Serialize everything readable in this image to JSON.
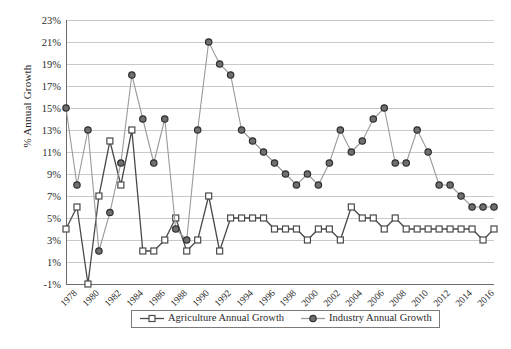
{
  "chart_data": {
    "type": "line",
    "title": "",
    "xlabel": "",
    "ylabel": "% Annual Growth",
    "ylim": [
      -1,
      23
    ],
    "ytick_step": 2,
    "ytick_labels": [
      "23%",
      "21%",
      "19%",
      "17%",
      "15%",
      "13%",
      "11%",
      "9%",
      "7%",
      "5%",
      "3%",
      "1%",
      "-1%"
    ],
    "ytick_values": [
      23,
      21,
      19,
      17,
      15,
      13,
      11,
      9,
      7,
      5,
      3,
      1,
      -1
    ],
    "grid": true,
    "legend_position": "bottom-center",
    "x": [
      1978,
      1979,
      1980,
      1981,
      1982,
      1983,
      1984,
      1985,
      1986,
      1987,
      1988,
      1989,
      1990,
      1991,
      1992,
      1993,
      1994,
      1995,
      1996,
      1997,
      1998,
      1999,
      2000,
      2001,
      2002,
      2003,
      2004,
      2005,
      2006,
      2007,
      2008,
      2009,
      2010,
      2011,
      2012,
      2013,
      2014,
      2015,
      2016,
      2017
    ],
    "xtick_labels": [
      "1978",
      "1980",
      "1982",
      "1984",
      "1986",
      "1988",
      "1990",
      "1992",
      "1994",
      "1996",
      "1998",
      "2000",
      "2002",
      "2004",
      "2006",
      "2008",
      "2010",
      "2012",
      "2014",
      "2016"
    ],
    "xtick_values": [
      1978,
      1980,
      1982,
      1984,
      1986,
      1988,
      1990,
      1992,
      1994,
      1996,
      1998,
      2000,
      2002,
      2004,
      2006,
      2008,
      2010,
      2012,
      2014,
      2016
    ],
    "series": [
      {
        "name": "Agriculture Annual Growth",
        "marker": "square",
        "color": "#595959",
        "line_color": "#4a4a4a",
        "values": [
          4,
          6,
          -1,
          7,
          12,
          8,
          13,
          2,
          2,
          3,
          5,
          2,
          3,
          7,
          2,
          5,
          5,
          5,
          5,
          4,
          4,
          4,
          3,
          4,
          4,
          3,
          6,
          5,
          5,
          4,
          5,
          4,
          4,
          4,
          4,
          4,
          4,
          4,
          3,
          4
        ]
      },
      {
        "name": "Industry Annual Growth",
        "marker": "circle",
        "color": "#4f4f4f",
        "line_color": "#9a9a9a",
        "values": [
          15,
          8,
          13,
          2,
          5.5,
          10,
          18,
          14,
          10,
          14,
          4,
          3,
          13,
          21,
          19,
          18,
          13,
          12,
          11,
          10,
          9,
          8,
          9,
          8,
          10,
          13,
          11,
          12,
          14,
          15,
          10,
          10,
          13,
          11,
          8,
          8,
          7,
          6,
          6,
          6
        ]
      }
    ]
  },
  "legend": {
    "items": [
      {
        "label": "Agriculture Annual Growth",
        "marker": "square"
      },
      {
        "label": "Industry Annual Growth",
        "marker": "circle"
      }
    ]
  },
  "axis_title": {
    "y": "% Annual Growth"
  }
}
